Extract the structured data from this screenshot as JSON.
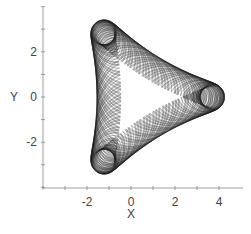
{
  "chart_data": {
    "type": "line",
    "title": "",
    "xlabel": "X",
    "ylabel": "Y",
    "xlim": [
      -4,
      5.1
    ],
    "ylim": [
      -4,
      4
    ],
    "grid": false,
    "legend": null,
    "x_tick_labels": [
      {
        "value": -2,
        "label": "-2"
      },
      {
        "value": 0,
        "label": "0"
      },
      {
        "value": 2,
        "label": "2"
      },
      {
        "value": 4,
        "label": "4"
      }
    ],
    "y_tick_labels": [
      {
        "value": 2,
        "label": "2"
      },
      {
        "value": 0,
        "label": "0"
      },
      {
        "value": -2,
        "label": "-2"
      }
    ],
    "x_minor_ticks": [
      -4,
      -3,
      -2,
      -1,
      0,
      1,
      2,
      3,
      4
    ],
    "y_minor_ticks": [
      -4,
      -3,
      -2,
      -1,
      0,
      1,
      2,
      3,
      4
    ],
    "series": [
      {
        "name": "orbit",
        "description": "Quasi-periodic trajectory in the X-Y plane forming a rounded triangular envelope with a three-pointed inner caustic",
        "color": "#1a1a1a",
        "envelope": {
          "x_min": -2.9,
          "x_max": 4.0,
          "y_min": -3.6,
          "y_max": 3.6
        },
        "components": [
          {
            "amp": 2.35,
            "freq": 1.0,
            "phase": 0.0
          },
          {
            "amp": 0.95,
            "freq": -2.0,
            "phase": 0.0
          },
          {
            "amp": 0.55,
            "freq": 7.137,
            "phase": 0.3
          }
        ],
        "t_max": 260,
        "samples": 9000,
        "x_offset": 0.4
      }
    ]
  },
  "axes": {
    "x_title": "X",
    "y_title": "Y"
  }
}
